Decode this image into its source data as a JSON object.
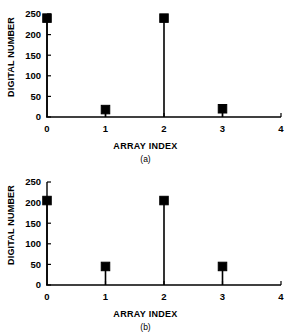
{
  "figure": {
    "panels": [
      {
        "id": "a",
        "caption": "(a)",
        "xlabel": "ARRAY INDEX",
        "ylabel": "DIGITAL NUMBER"
      },
      {
        "id": "b",
        "caption": "(b)",
        "xlabel": "ARRAY INDEX",
        "ylabel": "DIGITAL NUMBER"
      }
    ]
  },
  "chart_data": [
    {
      "type": "scatter",
      "title": "",
      "subtitle": "(a)",
      "xlabel": "ARRAY INDEX",
      "ylabel": "DIGITAL NUMBER",
      "x": [
        0,
        1,
        2,
        3
      ],
      "values": [
        240,
        18,
        240,
        20
      ],
      "xlim": [
        0,
        4
      ],
      "ylim": [
        0,
        250
      ],
      "xticks": [
        0,
        1,
        2,
        3,
        4
      ],
      "xticklabels": [
        "0",
        "1",
        "2",
        "3",
        "4"
      ],
      "yticks": [
        0,
        50,
        100,
        150,
        200,
        250
      ],
      "yticklabels": [
        "0",
        "50",
        "100",
        "150",
        "200",
        "250"
      ],
      "grid": false,
      "legend": false,
      "marker": "square",
      "marker_color": "#000000",
      "stems": true
    },
    {
      "type": "scatter",
      "title": "",
      "subtitle": "(b)",
      "xlabel": "ARRAY INDEX",
      "ylabel": "DIGITAL NUMBER",
      "x": [
        0,
        1,
        2,
        3
      ],
      "values": [
        205,
        45,
        205,
        45
      ],
      "xlim": [
        0,
        4
      ],
      "ylim": [
        0,
        250
      ],
      "xticks": [
        0,
        1,
        2,
        3,
        4
      ],
      "xticklabels": [
        "0",
        "1",
        "2",
        "3",
        "4"
      ],
      "yticks": [
        0,
        50,
        100,
        150,
        200,
        250
      ],
      "yticklabels": [
        "0",
        "50",
        "100",
        "150",
        "200",
        "250"
      ],
      "grid": false,
      "legend": false,
      "marker": "square",
      "marker_color": "#000000",
      "stems": true
    }
  ]
}
